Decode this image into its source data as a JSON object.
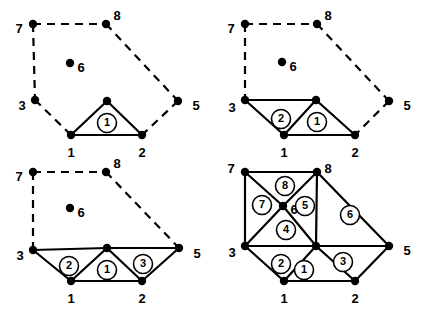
{
  "figure": {
    "width": 427,
    "height": 317,
    "background": "#ffffff",
    "stroke_color": "#000000",
    "node_radius": 4.2,
    "solid_width": 2.2,
    "dashed_width": 2.2,
    "dash_pattern": "8,6",
    "element_circle_radius": 9.5
  },
  "panels": [
    {
      "id": "panel-1",
      "name": "panel-top-left",
      "origin": [
        0,
        0
      ],
      "nodes": [
        {
          "id": "1",
          "label": "1",
          "x": 71,
          "y": 135,
          "lx": 71,
          "ly": 154,
          "anchor": "middle"
        },
        {
          "id": "2",
          "label": "2",
          "x": 142,
          "y": 135,
          "lx": 142,
          "ly": 154,
          "anchor": "middle"
        },
        {
          "id": "3",
          "label": "3",
          "x": 35,
          "y": 100,
          "lx": 22,
          "ly": 107,
          "anchor": "middle"
        },
        {
          "id": "4",
          "label": "",
          "x": 107,
          "y": 101,
          "lx": 107,
          "ly": 101,
          "anchor": "middle"
        },
        {
          "id": "5",
          "label": "5",
          "x": 178,
          "y": 101,
          "lx": 196,
          "ly": 107,
          "anchor": "middle"
        },
        {
          "id": "6",
          "label": "6",
          "x": 70,
          "y": 63,
          "lx": 81,
          "ly": 69,
          "anchor": "middle"
        },
        {
          "id": "7",
          "label": "7",
          "x": 33,
          "y": 24,
          "lx": 19,
          "ly": 30,
          "anchor": "middle"
        },
        {
          "id": "8",
          "label": "8",
          "x": 106,
          "y": 24,
          "lx": 117,
          "ly": 17,
          "anchor": "middle"
        }
      ],
      "solid_edges": [
        [
          "1",
          "4"
        ],
        [
          "4",
          "2"
        ],
        [
          "1",
          "2"
        ]
      ],
      "dashed_edges": [
        [
          "7",
          "8"
        ],
        [
          "7",
          "3"
        ],
        [
          "3",
          "1"
        ],
        [
          "8",
          "5"
        ],
        [
          "5",
          "2"
        ]
      ],
      "elements": [
        {
          "label": "1",
          "x": 107,
          "y": 123
        }
      ]
    },
    {
      "id": "panel-2",
      "name": "panel-top-right",
      "origin": [
        213,
        0
      ],
      "nodes": [
        {
          "id": "1",
          "label": "1",
          "x": 284,
          "y": 135,
          "lx": 284,
          "ly": 154,
          "anchor": "middle"
        },
        {
          "id": "2",
          "label": "2",
          "x": 355,
          "y": 135,
          "lx": 355,
          "ly": 154,
          "anchor": "middle"
        },
        {
          "id": "3",
          "label": "3",
          "x": 245,
          "y": 100,
          "lx": 232,
          "ly": 109,
          "anchor": "middle"
        },
        {
          "id": "4",
          "label": "",
          "x": 316,
          "y": 100,
          "lx": 316,
          "ly": 100,
          "anchor": "middle"
        },
        {
          "id": "5",
          "label": "5",
          "x": 389,
          "y": 101,
          "lx": 407,
          "ly": 107,
          "anchor": "middle"
        },
        {
          "id": "6",
          "label": "6",
          "x": 282,
          "y": 62,
          "lx": 293,
          "ly": 68,
          "anchor": "middle"
        },
        {
          "id": "7",
          "label": "7",
          "x": 245,
          "y": 24,
          "lx": 231,
          "ly": 30,
          "anchor": "middle"
        },
        {
          "id": "8",
          "label": "8",
          "x": 317,
          "y": 24,
          "lx": 328,
          "ly": 17,
          "anchor": "middle"
        }
      ],
      "solid_edges": [
        [
          "3",
          "4"
        ],
        [
          "3",
          "1"
        ],
        [
          "1",
          "4"
        ],
        [
          "4",
          "2"
        ],
        [
          "1",
          "2"
        ]
      ],
      "dashed_edges": [
        [
          "7",
          "8"
        ],
        [
          "7",
          "3"
        ],
        [
          "8",
          "5"
        ],
        [
          "5",
          "2"
        ]
      ],
      "elements": [
        {
          "label": "2",
          "x": 281,
          "y": 119
        },
        {
          "label": "1",
          "x": 317,
          "y": 122
        }
      ]
    },
    {
      "id": "panel-3",
      "name": "panel-bottom-left",
      "origin": [
        0,
        158
      ],
      "nodes": [
        {
          "id": "1",
          "label": "1",
          "x": 71,
          "y": 281,
          "lx": 71,
          "ly": 300,
          "anchor": "middle"
        },
        {
          "id": "2",
          "label": "2",
          "x": 142,
          "y": 281,
          "lx": 142,
          "ly": 300,
          "anchor": "middle"
        },
        {
          "id": "3",
          "label": "3",
          "x": 33,
          "y": 250,
          "lx": 20,
          "ly": 257,
          "anchor": "middle"
        },
        {
          "id": "4",
          "label": "",
          "x": 107,
          "y": 248,
          "lx": 107,
          "ly": 248,
          "anchor": "middle"
        },
        {
          "id": "5",
          "label": "5",
          "x": 179,
          "y": 248,
          "lx": 197,
          "ly": 255,
          "anchor": "middle"
        },
        {
          "id": "6",
          "label": "6",
          "x": 70,
          "y": 208,
          "lx": 81,
          "ly": 214,
          "anchor": "middle"
        },
        {
          "id": "7",
          "label": "7",
          "x": 33,
          "y": 172,
          "lx": 19,
          "ly": 178,
          "anchor": "middle"
        },
        {
          "id": "8",
          "label": "8",
          "x": 106,
          "y": 172,
          "lx": 117,
          "ly": 165,
          "anchor": "middle"
        }
      ],
      "solid_edges": [
        [
          "3",
          "4"
        ],
        [
          "4",
          "5"
        ],
        [
          "3",
          "1"
        ],
        [
          "1",
          "4"
        ],
        [
          "4",
          "2"
        ],
        [
          "1",
          "2"
        ],
        [
          "2",
          "5"
        ]
      ],
      "dashed_edges": [
        [
          "7",
          "8"
        ],
        [
          "7",
          "3"
        ],
        [
          "8",
          "5"
        ]
      ],
      "elements": [
        {
          "label": "2",
          "x": 69,
          "y": 266
        },
        {
          "label": "1",
          "x": 107,
          "y": 270
        },
        {
          "label": "3",
          "x": 143,
          "y": 264
        }
      ]
    },
    {
      "id": "panel-4",
      "name": "panel-bottom-right",
      "origin": [
        213,
        158
      ],
      "nodes": [
        {
          "id": "1",
          "label": "1",
          "x": 284,
          "y": 281,
          "lx": 284,
          "ly": 300,
          "anchor": "middle"
        },
        {
          "id": "2",
          "label": "2",
          "x": 355,
          "y": 281,
          "lx": 355,
          "ly": 300,
          "anchor": "middle"
        },
        {
          "id": "3",
          "label": "3",
          "x": 245,
          "y": 246,
          "lx": 232,
          "ly": 254,
          "anchor": "middle"
        },
        {
          "id": "4",
          "label": "",
          "x": 316,
          "y": 246,
          "lx": 316,
          "ly": 246,
          "anchor": "middle"
        },
        {
          "id": "5",
          "label": "5",
          "x": 389,
          "y": 246,
          "lx": 407,
          "ly": 252,
          "anchor": "middle"
        },
        {
          "id": "6",
          "label": "6",
          "x": 283,
          "y": 206,
          "lx": 294,
          "ly": 211,
          "anchor": "middle"
        },
        {
          "id": "7",
          "label": "7",
          "x": 245,
          "y": 172,
          "lx": 231,
          "ly": 170,
          "anchor": "middle"
        },
        {
          "id": "8",
          "label": "8",
          "x": 317,
          "y": 172,
          "lx": 328,
          "ly": 170,
          "anchor": "middle"
        }
      ],
      "solid_edges": [
        [
          "7",
          "8"
        ],
        [
          "7",
          "3"
        ],
        [
          "3",
          "4"
        ],
        [
          "4",
          "5"
        ],
        [
          "8",
          "5"
        ],
        [
          "3",
          "1"
        ],
        [
          "1",
          "4"
        ],
        [
          "4",
          "2"
        ],
        [
          "1",
          "2"
        ],
        [
          "2",
          "5"
        ],
        [
          "7",
          "6"
        ],
        [
          "6",
          "8"
        ],
        [
          "3",
          "6"
        ],
        [
          "6",
          "4"
        ],
        [
          "4",
          "8"
        ]
      ],
      "dashed_edges": [],
      "elements": [
        {
          "label": "1",
          "x": 304,
          "y": 270
        },
        {
          "label": "2",
          "x": 281,
          "y": 264
        },
        {
          "label": "3",
          "x": 343,
          "y": 262
        },
        {
          "label": "4",
          "x": 286,
          "y": 230
        },
        {
          "label": "5",
          "x": 305,
          "y": 206
        },
        {
          "label": "6",
          "x": 350,
          "y": 215
        },
        {
          "label": "7",
          "x": 262,
          "y": 205
        },
        {
          "label": "8",
          "x": 285,
          "y": 186
        }
      ]
    }
  ]
}
